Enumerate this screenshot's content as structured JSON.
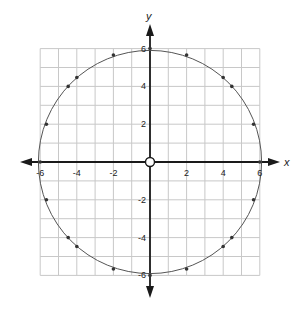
{
  "chart_data": {
    "type": "scatter",
    "title": "",
    "xlabel": "x",
    "ylabel": "y",
    "xlim": [
      -6,
      6
    ],
    "ylim": [
      -6,
      6
    ],
    "grid": true,
    "grid_step": 1,
    "x_ticks": [
      -6,
      -4,
      -2,
      2,
      4,
      6
    ],
    "y_ticks": [
      6,
      4,
      2,
      -2,
      -4,
      -6
    ],
    "x_tick_labels": [
      "-6",
      "-4",
      "-2",
      "2",
      "4",
      "6"
    ],
    "y_tick_labels": [
      "6",
      "4",
      "2",
      "-2",
      "-4",
      "-6"
    ],
    "curve": {
      "shape": "circle",
      "center": [
        0,
        0
      ],
      "radius": 6
    },
    "origin_marker": {
      "x": 0,
      "y": 0,
      "style": "hollow-circle"
    },
    "points": [
      {
        "x": 6,
        "y": 0
      },
      {
        "x": 5.66,
        "y": 2
      },
      {
        "x": 4.47,
        "y": 4
      },
      {
        "x": 4,
        "y": 4.47
      },
      {
        "x": 2,
        "y": 5.66
      },
      {
        "x": 0,
        "y": 6
      },
      {
        "x": -2,
        "y": 5.66
      },
      {
        "x": -4,
        "y": 4.47
      },
      {
        "x": -4.47,
        "y": 4
      },
      {
        "x": -5.66,
        "y": 2
      },
      {
        "x": -6,
        "y": 0
      },
      {
        "x": -5.66,
        "y": -2
      },
      {
        "x": -4.47,
        "y": -4
      },
      {
        "x": -4,
        "y": -4.47
      },
      {
        "x": -2,
        "y": -5.66
      },
      {
        "x": 0,
        "y": -6
      },
      {
        "x": 2,
        "y": -5.66
      },
      {
        "x": 4,
        "y": -4.47
      },
      {
        "x": 4.47,
        "y": -4
      },
      {
        "x": 5.66,
        "y": -2
      }
    ]
  }
}
